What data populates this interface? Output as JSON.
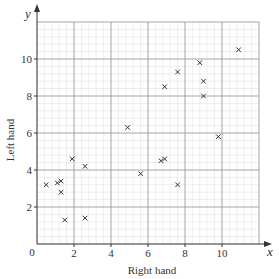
{
  "chart_data": {
    "type": "scatter",
    "title": "",
    "xlabel": "Right hand",
    "ylabel": "Left hand",
    "x_axis_letter": "x",
    "y_axis_letter": "y",
    "origin_label": "0",
    "xlim": [
      0,
      12
    ],
    "ylim": [
      0,
      12
    ],
    "x_ticks": [
      2,
      4,
      6,
      8,
      10
    ],
    "y_ticks": [
      2,
      4,
      6,
      8,
      10
    ],
    "grid": true,
    "marker": "x",
    "points": [
      {
        "x": 0.5,
        "y": 3.2
      },
      {
        "x": 1.1,
        "y": 3.3
      },
      {
        "x": 1.3,
        "y": 2.8
      },
      {
        "x": 1.3,
        "y": 3.4
      },
      {
        "x": 1.5,
        "y": 1.3
      },
      {
        "x": 1.9,
        "y": 4.6
      },
      {
        "x": 2.6,
        "y": 4.2
      },
      {
        "x": 2.6,
        "y": 1.4
      },
      {
        "x": 4.9,
        "y": 6.3
      },
      {
        "x": 5.6,
        "y": 3.8
      },
      {
        "x": 6.7,
        "y": 4.5
      },
      {
        "x": 6.9,
        "y": 4.6
      },
      {
        "x": 6.9,
        "y": 8.5
      },
      {
        "x": 7.6,
        "y": 9.3
      },
      {
        "x": 7.6,
        "y": 3.2
      },
      {
        "x": 8.8,
        "y": 9.8
      },
      {
        "x": 9.0,
        "y": 8.8
      },
      {
        "x": 9.0,
        "y": 8.0
      },
      {
        "x": 9.8,
        "y": 5.8
      },
      {
        "x": 10.9,
        "y": 10.5
      }
    ]
  },
  "colors": {
    "axis": "#333333",
    "major_grid": "#9a9a9a",
    "minor_grid": "#dcdcdc",
    "marker": "#333333",
    "text": "#333333"
  }
}
